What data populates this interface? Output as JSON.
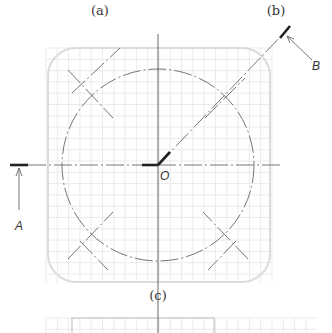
{
  "figure": {
    "panel_labels": {
      "a": "(a)",
      "b": "(b)",
      "c": "(c)"
    },
    "center_label": "O",
    "section_labels": {
      "A": "A",
      "B": "B"
    }
  },
  "colors": {
    "grid": "#e6e6e6",
    "frame": "#dcdcdc",
    "line": "#555555",
    "thick_line": "#222222"
  }
}
